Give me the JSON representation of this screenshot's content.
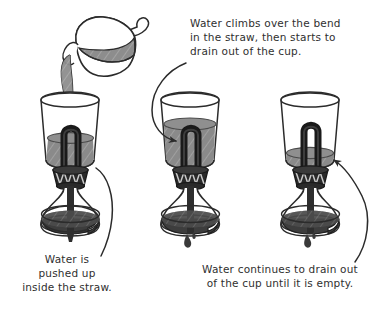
{
  "figure": {
    "background_color": "#ffffff",
    "ink_color": "#2b2b2b",
    "water_color": "#8a8a8a",
    "straw_color": "#1a1a1a"
  },
  "captions": {
    "top": {
      "name": "caption-climbs-over-bend",
      "lines": [
        "Water climbs over the bend",
        "in the straw, then starts to",
        "drain out of the cup."
      ]
    },
    "left": {
      "name": "caption-pushed-up",
      "lines": [
        "Water is",
        "pushed up",
        "inside the straw."
      ]
    },
    "right": {
      "name": "caption-continues-to-drain",
      "lines": [
        "Water continues to drain out",
        "of the cup until it is empty."
      ]
    }
  },
  "panels": [
    {
      "id": "panel-1",
      "label": "pouring",
      "has_pitcher": true,
      "pouring": true,
      "water_level": "low",
      "dripping": false,
      "caption": "left"
    },
    {
      "id": "panel-2",
      "label": "full-and-starting-to-drain",
      "has_pitcher": false,
      "pouring": false,
      "water_level": "high",
      "dripping": true,
      "caption": "top"
    },
    {
      "id": "panel-3",
      "label": "draining-until-empty",
      "has_pitcher": false,
      "pouring": false,
      "water_level": "very-low",
      "dripping": true,
      "caption": "right"
    }
  ],
  "apparatus_parts": [
    "cup",
    "bent-straw-siphon",
    "coiled-neck",
    "flask",
    "ring-stand-base",
    "water-drip"
  ]
}
